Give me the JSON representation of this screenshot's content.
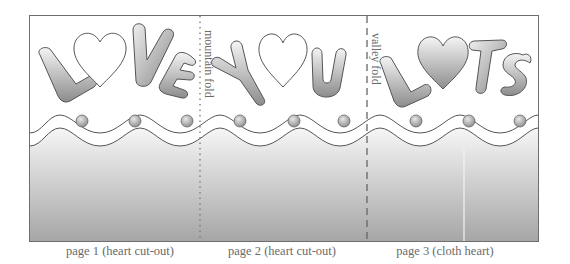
{
  "template": {
    "title_words": [
      "LOVE",
      "YOU",
      "LOTS"
    ],
    "pages": [
      {
        "id": "page-1",
        "word": "LOVE",
        "heart_style": "cut-out",
        "caption": "page 1 (heart cut-out)"
      },
      {
        "id": "page-2",
        "word": "YOU",
        "heart_style": "cut-out",
        "caption": "page 2 (heart cut-out)"
      },
      {
        "id": "page-3",
        "word": "LOTS",
        "heart_style": "filled",
        "caption": "page 3 (cloth heart)"
      }
    ],
    "folds": [
      {
        "type": "mountain",
        "label": "mountain fold",
        "line_style": "dotted"
      },
      {
        "type": "valley",
        "label": "valley fold",
        "line_style": "dashed"
      }
    ],
    "decoration": {
      "wave_bands": 2,
      "dots_per_page": 3
    },
    "colors": {
      "outline": "#555555",
      "letter_light": "#f2f2f2",
      "letter_dark": "#8a8a8a",
      "band_top": "#f4f4f4",
      "band_bottom": "#a8a8a8",
      "caption": "#6a6a6a"
    }
  }
}
